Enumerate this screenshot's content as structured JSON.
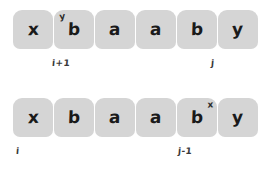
{
  "diagram": {
    "type": "string-index-illustration",
    "cell_color": "#d5d5d5",
    "text_color": "#1a1a1a",
    "background": "#ffffff",
    "rows": [
      {
        "name": "top-row",
        "cells": [
          {
            "text": "x",
            "sup_pre": "",
            "sup_post": ""
          },
          {
            "text": "b",
            "sup_pre": "y",
            "sup_post": ""
          },
          {
            "text": "a",
            "sup_pre": "",
            "sup_post": ""
          },
          {
            "text": "a",
            "sup_pre": "",
            "sup_post": ""
          },
          {
            "text": "b",
            "sup_pre": "",
            "sup_post": ""
          },
          {
            "text": "y",
            "sup_pre": "",
            "sup_post": ""
          }
        ],
        "labels": [
          {
            "text": "i+1"
          },
          {
            "text": "j"
          }
        ]
      },
      {
        "name": "bottom-row",
        "cells": [
          {
            "text": "x",
            "sup_pre": "",
            "sup_post": ""
          },
          {
            "text": "b",
            "sup_pre": "",
            "sup_post": ""
          },
          {
            "text": "a",
            "sup_pre": "",
            "sup_post": ""
          },
          {
            "text": "a",
            "sup_pre": "",
            "sup_post": ""
          },
          {
            "text": "b",
            "sup_pre": "",
            "sup_post": "x"
          },
          {
            "text": "y",
            "sup_pre": "",
            "sup_post": ""
          }
        ],
        "labels": [
          {
            "text": "i"
          },
          {
            "text": "j-1"
          }
        ]
      }
    ]
  }
}
